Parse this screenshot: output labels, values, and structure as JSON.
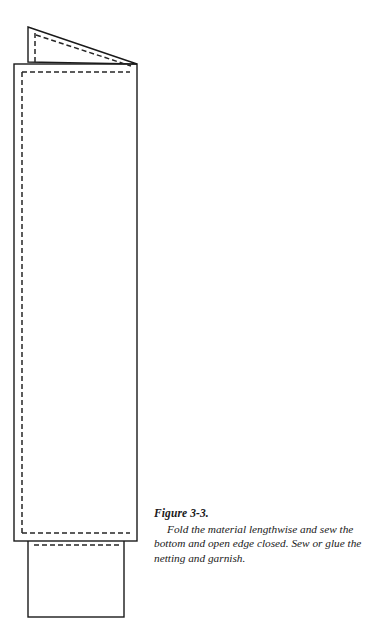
{
  "figure": {
    "label": "Figure 3-3.",
    "caption": "Fold the material lengthwise and sew the bottom and open edge closed. Sew or glue the netting and garnish.",
    "colors": {
      "outline": "#1a1a1a",
      "stitch": "#262626",
      "background": "#ffffff",
      "text": "#1a1a1a"
    },
    "parts": [
      {
        "name": "folded-flap",
        "description": "Triangular folded-back flap at the top of the material",
        "outline_points": "28,27 137,64 28,62",
        "stitch_line_top": "36,35 131,66",
        "stitch_line_left": "35,33 35,62"
      },
      {
        "name": "material-body",
        "description": "Tall folded rectangle of material",
        "rect": {
          "x": 14,
          "y": 64,
          "width": 123,
          "height": 477
        },
        "stitch_rect": {
          "x": 22,
          "y": 72,
          "width": 108,
          "height": 461
        }
      },
      {
        "name": "netting-panel",
        "description": "Netting rectangle attached at the bottom",
        "rect": {
          "x": 28,
          "y": 538,
          "width": 96,
          "height": 79
        },
        "stitch_line": "34,545 119,545"
      }
    ],
    "stitch_style": {
      "dash": "5 3",
      "width": 1.5
    }
  }
}
